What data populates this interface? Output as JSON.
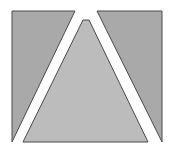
{
  "figure": {
    "colors": {
      "background": "#ffffff",
      "outer_fill": "#a9a9a9",
      "center_fill": "#bcbcbc",
      "stroke": "#4a4a4a"
    },
    "shapes": [
      {
        "name": "left-region",
        "points": "12,11 75,11 12,142"
      },
      {
        "name": "center-triangle",
        "points": "83,20 89,20 148,142 23,142"
      },
      {
        "name": "right-region",
        "points": "97,11 162,11 162,142"
      }
    ]
  }
}
